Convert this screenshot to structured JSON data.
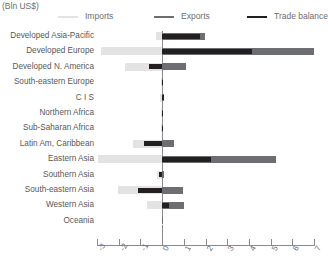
{
  "unit_label": "(Bln US$)",
  "legend": {
    "items": [
      {
        "label": "Imports",
        "color": "#e3e3e3",
        "name": "legend-imports"
      },
      {
        "label": "Exports",
        "color": "#6d6e71",
        "name": "legend-exports"
      },
      {
        "label": "Trade balance",
        "color": "#231f20",
        "name": "legend-balance"
      }
    ]
  },
  "chart_data": {
    "type": "bar",
    "orientation": "horizontal",
    "title": "",
    "subtitle": "",
    "xlabel": "(Bln US$)",
    "ylabel": "",
    "xlim": [
      -3,
      7
    ],
    "xticks": [
      -3,
      -2,
      -1,
      0,
      1,
      2,
      3,
      4,
      5,
      6,
      7
    ],
    "xticklabels": [
      "-3",
      "-2",
      "-1",
      "0",
      "1",
      "2",
      "3",
      "4",
      "5",
      "6",
      "7"
    ],
    "grid": false,
    "legend_position": "top",
    "categories": [
      "Developed Asia-Pacific",
      "Developed Europe",
      "Developed N. America",
      "South-eastern Europe",
      "C I S",
      "Northern Africa",
      "Sub-Saharan Africa",
      "Latin Am, Caribbean",
      "Eastern Asia",
      "Southern Asia",
      "South-eastern Asia",
      "Western Asia",
      "Oceania"
    ],
    "series": [
      {
        "name": "Imports",
        "color": "#e3e3e3",
        "values": [
          -0.3,
          -2.8,
          -1.7,
          -0.05,
          -0.1,
          -0.05,
          -0.05,
          -1.35,
          -2.95,
          -0.25,
          -2.05,
          -0.7,
          -0.02
        ]
      },
      {
        "name": "Exports",
        "color": "#6d6e71",
        "values": [
          2.0,
          7.0,
          1.1,
          0.05,
          0.1,
          0.05,
          0.05,
          0.55,
          5.25,
          0.1,
          0.95,
          1.0,
          0.02
        ]
      },
      {
        "name": "Trade balance",
        "color": "#231f20",
        "values": [
          1.75,
          4.15,
          -0.6,
          0.02,
          0.08,
          0.03,
          0.04,
          -0.85,
          2.25,
          -0.15,
          -1.1,
          0.3,
          0.01
        ]
      }
    ]
  }
}
